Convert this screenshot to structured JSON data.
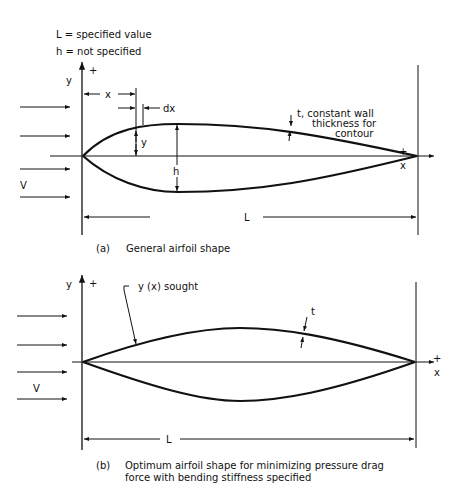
{
  "legend": {
    "line1": "L =  specified value",
    "line2": "h =  not specified"
  },
  "figure_a": {
    "y_axis_label": "y",
    "y_plus": "+",
    "x_axis_label": "x",
    "x_plus": "+",
    "x_dim": "x",
    "dx_dim": "dx",
    "y_dim": "y",
    "h_dim": "h",
    "velocity": "V",
    "length": "L",
    "wall_note_1": "t,  constant wall",
    "wall_note_2": "thickness for",
    "wall_note_3": "contour",
    "caption_tag": "(a)",
    "caption": "General airfoil shape"
  },
  "figure_b": {
    "y_axis_label": "y",
    "y_plus": "+",
    "x_axis_label": "x",
    "x_plus": "+",
    "sought_label": "y (x) sought",
    "t_label": "t",
    "velocity": "V",
    "length": "L",
    "caption_tag": "(b)",
    "caption_line1": "Optimum airfoil shape for minimizing pressure drag",
    "caption_line2": "force with bending stiffness specified"
  }
}
